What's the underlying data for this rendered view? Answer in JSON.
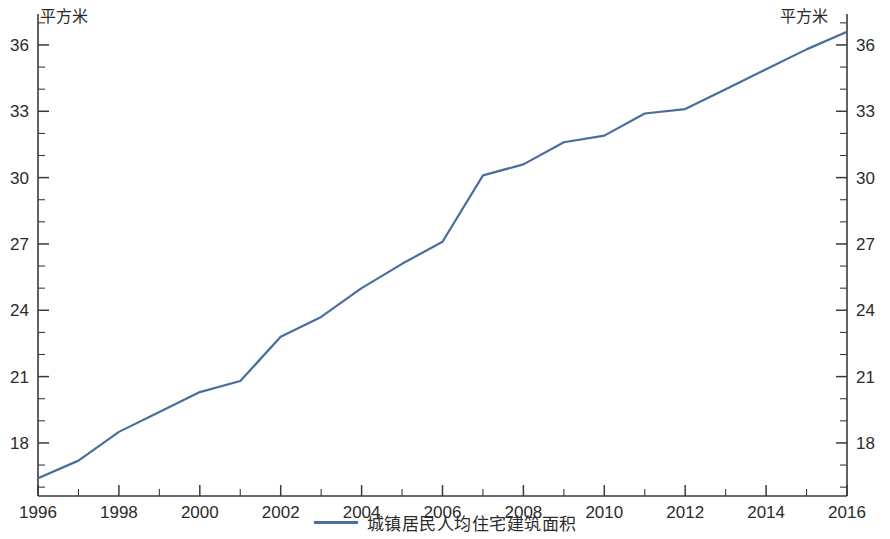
{
  "chart_data": {
    "type": "line",
    "title": "",
    "xlabel": "",
    "ylabel": "",
    "left_unit_label": "平方米",
    "right_unit_label": "平方米",
    "legend_position": "bottom-center",
    "grid": false,
    "dual_axis": true,
    "xlim": [
      1996,
      2016
    ],
    "ylim": [
      15.6,
      37.4
    ],
    "y_ticks": [
      18,
      21,
      24,
      27,
      30,
      33,
      36
    ],
    "y_tick_labels": [
      "18",
      "21",
      "24",
      "27",
      "30",
      "33",
      "36"
    ],
    "y_minor_ticks": [
      16,
      17,
      19,
      20,
      22,
      23,
      25,
      26,
      28,
      29,
      31,
      32,
      34,
      35,
      37
    ],
    "x_ticks": [
      1996,
      1998,
      2000,
      2002,
      2004,
      2006,
      2008,
      2010,
      2012,
      2014,
      2016
    ],
    "x_tick_labels": [
      "1996",
      "1998",
      "2000",
      "2002",
      "2004",
      "2006",
      "2008",
      "2010",
      "2012",
      "2014",
      "2016"
    ],
    "x_minor_ticks": [
      1997,
      1999,
      2001,
      2003,
      2005,
      2007,
      2009,
      2011,
      2013,
      2015
    ],
    "series": [
      {
        "name": "城镇居民人均住宅建筑面积",
        "color": "#4a6d9e",
        "x": [
          1996,
          1997,
          1998,
          1999,
          2000,
          2001,
          2002,
          2003,
          2004,
          2005,
          2006,
          2007,
          2008,
          2009,
          2010,
          2011,
          2012,
          2013,
          2014,
          2015,
          2016
        ],
        "values": [
          16.4,
          17.2,
          18.5,
          19.4,
          20.3,
          20.8,
          22.8,
          23.7,
          25.0,
          26.1,
          27.1,
          30.1,
          30.6,
          31.6,
          31.9,
          32.9,
          33.1,
          34.0,
          34.9,
          35.8,
          36.6
        ]
      }
    ],
    "legend": [
      {
        "label": "城镇居民人均住宅建筑面积",
        "color": "#4a6d9e"
      }
    ]
  },
  "axes": {
    "left_unit": "平方米",
    "right_unit": "平方米"
  }
}
